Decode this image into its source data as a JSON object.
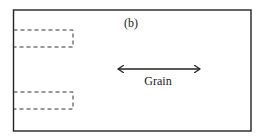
{
  "diagram": {
    "panel_label": "(b)",
    "arrow_label": "Grain",
    "arrow_direction": "horizontal, double-headed",
    "dashed_regions": [
      {
        "name": "upper-dashed-region",
        "x": 13,
        "y": 30,
        "width": 60,
        "height": 17
      },
      {
        "name": "lower-dashed-region",
        "x": 13,
        "y": 92,
        "width": 60,
        "height": 17
      }
    ],
    "colors": {
      "stroke": "#222222",
      "background": "#ffffff"
    }
  }
}
